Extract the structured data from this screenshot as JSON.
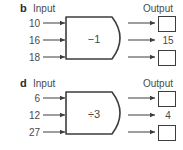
{
  "diagram": {
    "type": "function-machine",
    "panels": [
      {
        "letter": "b",
        "input_label": "Input",
        "output_label": "Output",
        "rule": "−1",
        "rows": [
          {
            "input": "10",
            "output": "",
            "output_is_box": true
          },
          {
            "input": "16",
            "output": "15",
            "output_is_box": false
          },
          {
            "input": "18",
            "output": "",
            "output_is_box": true
          }
        ]
      },
      {
        "letter": "d",
        "input_label": "Input",
        "output_label": "Output",
        "rule": "÷3",
        "rows": [
          {
            "input": "6",
            "output": "",
            "output_is_box": true
          },
          {
            "input": "12",
            "output": "4",
            "output_is_box": false
          },
          {
            "input": "27",
            "output": "",
            "output_is_box": true
          }
        ]
      }
    ]
  },
  "colors": {
    "background": "#ffffff",
    "stroke": "#3d3d3d",
    "text": "#4a4a4a",
    "letter": "#2b2b2b"
  }
}
